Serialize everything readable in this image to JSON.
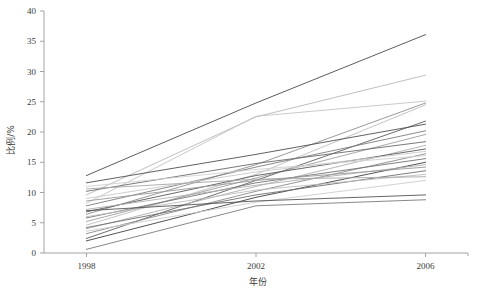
{
  "chart_data": {
    "type": "line",
    "title": "",
    "subtitle": "",
    "xlabel": "年份",
    "ylabel": "比例/%",
    "categories": [
      "1998",
      "2002",
      "2006"
    ],
    "x": [
      1998,
      2002,
      2006
    ],
    "xlim": [
      1997.0,
      2007.0
    ],
    "ylim": [
      0,
      40
    ],
    "yticks": [
      0,
      5,
      10,
      15,
      20,
      25,
      30,
      35,
      40
    ],
    "ytick_labels": [
      "0",
      "5",
      "10",
      "15",
      "20",
      "25",
      "30",
      "35",
      "40"
    ],
    "xticks": [
      1998,
      2002,
      2006
    ],
    "xtick_labels": [
      "1998",
      "2002",
      "2006"
    ],
    "grid": false,
    "legend": "none",
    "line_color_default": "#808080",
    "axis_color": "#9a9a9a",
    "series": [
      {
        "name": "s1",
        "values": [
          12.8,
          24.8,
          36.1
        ],
        "color": "#4a4a4a",
        "width": 0.9
      },
      {
        "name": "s2",
        "values": [
          9.6,
          22.5,
          29.4
        ],
        "color": "#b8b8b8",
        "width": 0.9
      },
      {
        "name": "s3",
        "values": [
          8.2,
          22.6,
          25.1
        ],
        "color": "#c4c4c4",
        "width": 0.9
      },
      {
        "name": "s4",
        "values": [
          6.4,
          14.6,
          24.8
        ],
        "color": "#8e8e8e",
        "width": 0.9
      },
      {
        "name": "s5",
        "values": [
          4.6,
          13.0,
          24.5
        ],
        "color": "#bdbdbd",
        "width": 0.9
      },
      {
        "name": "s6",
        "values": [
          2.4,
          12.0,
          21.8
        ],
        "color": "#5c5c5c",
        "width": 0.9
      },
      {
        "name": "s7",
        "values": [
          11.6,
          16.3,
          21.3
        ],
        "color": "#4f4f4f",
        "width": 0.9
      },
      {
        "name": "s8",
        "values": [
          7.8,
          14.2,
          20.2
        ],
        "color": "#7d7d7d",
        "width": 0.9
      },
      {
        "name": "s9",
        "values": [
          5.2,
          12.4,
          19.6
        ],
        "color": "#9e9e9e",
        "width": 0.9
      },
      {
        "name": "s10",
        "values": [
          10.2,
          14.8,
          18.4
        ],
        "color": "#6a6a6a",
        "width": 0.9
      },
      {
        "name": "s11",
        "values": [
          4.0,
          11.0,
          17.8
        ],
        "color": "#aeaeae",
        "width": 0.9
      },
      {
        "name": "s12",
        "values": [
          6.8,
          12.8,
          17.2
        ],
        "color": "#585858",
        "width": 0.9
      },
      {
        "name": "s13",
        "values": [
          9.0,
          13.4,
          16.8
        ],
        "color": "#c8c8c8",
        "width": 0.9
      },
      {
        "name": "s14",
        "values": [
          3.2,
          10.2,
          16.4
        ],
        "color": "#8a8a8a",
        "width": 0.9
      },
      {
        "name": "s15",
        "values": [
          11.0,
          13.8,
          16.1
        ],
        "color": "#d0d0d0",
        "width": 0.9
      },
      {
        "name": "s16",
        "values": [
          5.8,
          11.6,
          15.6
        ],
        "color": "#737373",
        "width": 0.9
      },
      {
        "name": "s17",
        "values": [
          2.0,
          9.2,
          15.0
        ],
        "color": "#3f3f3f",
        "width": 0.9
      },
      {
        "name": "s18",
        "values": [
          7.2,
          11.2,
          14.6
        ],
        "color": "#b0b0b0",
        "width": 0.9
      },
      {
        "name": "s19",
        "values": [
          8.6,
          12.0,
          14.2
        ],
        "color": "#9a9a9a",
        "width": 0.9
      },
      {
        "name": "s20",
        "values": [
          4.2,
          9.6,
          13.6
        ],
        "color": "#6e6e6e",
        "width": 0.9
      },
      {
        "name": "s21",
        "values": [
          6.0,
          10.4,
          13.0
        ],
        "color": "#bcbcbc",
        "width": 0.9
      },
      {
        "name": "s22",
        "values": [
          10.6,
          12.2,
          12.6
        ],
        "color": "#a6a6a6",
        "width": 0.9
      },
      {
        "name": "s23",
        "values": [
          3.6,
          8.4,
          12.0
        ],
        "color": "#cccccc",
        "width": 0.9
      },
      {
        "name": "s24",
        "values": [
          7.0,
          8.6,
          9.6
        ],
        "color": "#555555",
        "width": 0.9
      },
      {
        "name": "s25",
        "values": [
          0.6,
          7.8,
          8.8
        ],
        "color": "#7a7a7a",
        "width": 0.9
      }
    ],
    "annotations": []
  }
}
